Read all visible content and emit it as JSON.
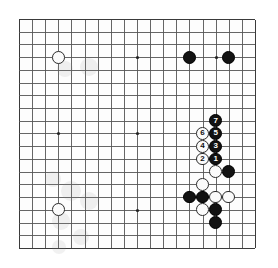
{
  "app": {
    "title": "Go Board Diagram",
    "kind": "go-game-diagram"
  },
  "board": {
    "size": 19,
    "line_color": "#555555",
    "border_color": "#3a3a3a",
    "background_color": "#fdfdfd",
    "black_stone_color": "#121212",
    "white_stone_color": "#fbfbfb",
    "star_point_color": "#222222",
    "origin_x": 19,
    "origin_y": 19,
    "spacing_x": 13.11,
    "spacing_y": 12.72,
    "star_points": [
      {
        "col": 3,
        "row": 3
      },
      {
        "col": 9,
        "row": 3
      },
      {
        "col": 15,
        "row": 3
      },
      {
        "col": 3,
        "row": 9
      },
      {
        "col": 9,
        "row": 9
      },
      {
        "col": 15,
        "row": 9
      },
      {
        "col": 3,
        "row": 15
      },
      {
        "col": 9,
        "row": 15
      },
      {
        "col": 15,
        "row": 15
      }
    ],
    "stone_radius": 6.4,
    "star_radius": 1.6
  },
  "stones": [
    {
      "col": 3,
      "row": 3,
      "color": "white",
      "label": ""
    },
    {
      "col": 13,
      "row": 3,
      "color": "black",
      "label": ""
    },
    {
      "col": 16,
      "row": 3,
      "color": "black",
      "label": ""
    },
    {
      "col": 3,
      "row": 15,
      "color": "white",
      "label": ""
    },
    {
      "col": 15,
      "row": 8,
      "color": "black",
      "label": "7"
    },
    {
      "col": 14,
      "row": 9,
      "color": "white",
      "label": "6"
    },
    {
      "col": 15,
      "row": 9,
      "color": "black",
      "label": "5"
    },
    {
      "col": 14,
      "row": 10,
      "color": "white",
      "label": "4"
    },
    {
      "col": 15,
      "row": 10,
      "color": "black",
      "label": "3"
    },
    {
      "col": 14,
      "row": 11,
      "color": "white",
      "label": "2"
    },
    {
      "col": 15,
      "row": 11,
      "color": "black",
      "label": "1"
    },
    {
      "col": 15,
      "row": 12,
      "color": "white",
      "label": ""
    },
    {
      "col": 16,
      "row": 12,
      "color": "black",
      "label": ""
    },
    {
      "col": 14,
      "row": 13,
      "color": "white",
      "label": ""
    },
    {
      "col": 13,
      "row": 14,
      "color": "black",
      "label": ""
    },
    {
      "col": 14,
      "row": 14,
      "color": "black",
      "label": ""
    },
    {
      "col": 15,
      "row": 14,
      "color": "white",
      "label": ""
    },
    {
      "col": 16,
      "row": 14,
      "color": "white",
      "label": ""
    },
    {
      "col": 14,
      "row": 15,
      "color": "white",
      "label": ""
    },
    {
      "col": 15,
      "row": 15,
      "color": "black",
      "label": ""
    },
    {
      "col": 15,
      "row": 16,
      "color": "black",
      "label": ""
    }
  ],
  "ghost_marks": [
    {
      "x": 46,
      "y": 50,
      "d": 16
    },
    {
      "x": 70,
      "y": 48,
      "d": 18
    },
    {
      "x": 34,
      "y": 160,
      "d": 16
    },
    {
      "x": 52,
      "y": 172,
      "d": 20
    },
    {
      "x": 70,
      "y": 182,
      "d": 18
    },
    {
      "x": 42,
      "y": 202,
      "d": 18
    },
    {
      "x": 62,
      "y": 218,
      "d": 16
    },
    {
      "x": 40,
      "y": 228,
      "d": 14
    }
  ]
}
